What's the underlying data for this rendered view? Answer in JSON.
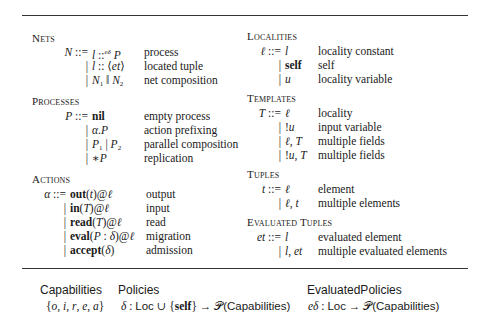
{
  "left_column": {
    "nets": {
      "title": "Nets",
      "rows": [
        {
          "lhs": "N ::=",
          "rhs": "l ::eδ P",
          "desc": "process"
        },
        {
          "lhs": "|",
          "rhs": "l :: ⟨et⟩",
          "desc": "located tuple"
        },
        {
          "lhs": "|",
          "rhs": "N1 ‖ N2",
          "desc": "net composition"
        }
      ]
    },
    "processes": {
      "title": "Processes",
      "rows": [
        {
          "lhs": "P ::=",
          "rhs": "nil",
          "desc": "empty process"
        },
        {
          "lhs": "|",
          "rhs": "α.P",
          "desc": "action prefixing"
        },
        {
          "lhs": "|",
          "rhs": "P1 | P2",
          "desc": "parallel composition"
        },
        {
          "lhs": "|",
          "rhs": "∗P",
          "desc": "replication"
        }
      ]
    },
    "actions": {
      "title": "Actions",
      "rows": [
        {
          "lhs": "α ::=",
          "rhs": "out(t)@ℓ",
          "desc": "output"
        },
        {
          "lhs": "|",
          "rhs": "in(T)@ℓ",
          "desc": "input"
        },
        {
          "lhs": "|",
          "rhs": "read(T)@ℓ",
          "desc": "read"
        },
        {
          "lhs": "|",
          "rhs": "eval(P : δ)@ℓ",
          "desc": "migration"
        },
        {
          "lhs": "|",
          "rhs": "accept(δ)",
          "desc": "admission"
        }
      ]
    }
  },
  "right_column": {
    "localities": {
      "title": "Localities",
      "rows": [
        {
          "lhs": "ℓ ::=",
          "rhs": "l",
          "desc": "locality constant"
        },
        {
          "lhs": "|",
          "rhs": "self",
          "desc": "self"
        },
        {
          "lhs": "|",
          "rhs": "u",
          "desc": "locality variable"
        }
      ]
    },
    "templates": {
      "title": "Templates",
      "rows": [
        {
          "lhs": "T ::=",
          "rhs": "ℓ",
          "desc": "locality"
        },
        {
          "lhs": "|",
          "rhs": "!u",
          "desc": "input variable"
        },
        {
          "lhs": "|",
          "rhs": "ℓ, T",
          "desc": "multiple fields"
        },
        {
          "lhs": "|",
          "rhs": "!u, T",
          "desc": "multiple fields"
        }
      ]
    },
    "tuples": {
      "title": "Tuples",
      "rows": [
        {
          "lhs": "t ::=",
          "rhs": "ℓ",
          "desc": "element"
        },
        {
          "lhs": "|",
          "rhs": "ℓ, t",
          "desc": "multiple elements"
        }
      ]
    },
    "evaluated_tuples": {
      "title": "Evaluated Tuples",
      "rows": [
        {
          "lhs": "et ::=",
          "rhs": "l",
          "desc": "evaluated element"
        },
        {
          "lhs": "|",
          "rhs": "l, et",
          "desc": "multiple evaluated elements"
        }
      ]
    }
  },
  "footer": {
    "capabilities": {
      "label": "Capabilities",
      "value": "{o, i, r, e, a}"
    },
    "policies": {
      "label": "Policies",
      "value": "δ : Loc ∪ {self} → 𝒫(Capabilities)"
    },
    "evaluated_policies": {
      "label": "EvaluatedPolicies",
      "value": "eδ : Loc → 𝒫(Capabilities)"
    }
  }
}
